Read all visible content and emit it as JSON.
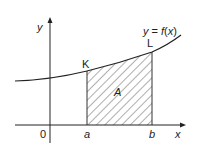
{
  "diagram": {
    "function_label": "y = f(x)",
    "axis_x_label": "x",
    "axis_y_label": "y",
    "origin_label": "0",
    "point_K_label": "K",
    "point_L_label": "L",
    "area_label": "A",
    "bound_a_label": "a",
    "bound_b_label": "b",
    "colors": {
      "line": "#222222",
      "background": "#ffffff"
    }
  }
}
